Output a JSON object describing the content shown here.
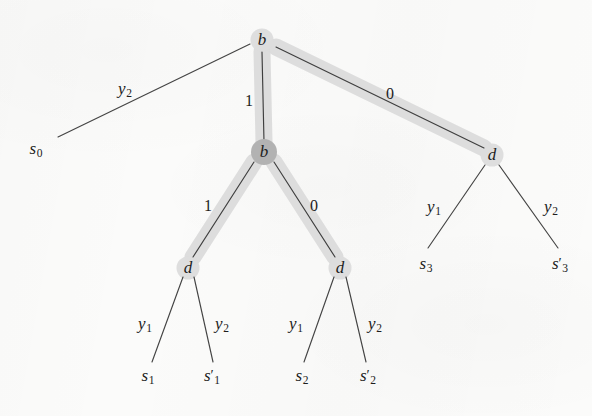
{
  "figure": {
    "kind": "tree-diagram",
    "background_color": "#fbfbfa",
    "ink_color": "#1d1d1d",
    "highlight_color": "#dcdcdc",
    "node_fill_light": "#d2d2d2",
    "node_fill_dark": "#b2b2b2"
  },
  "nodes": [
    {
      "id": "b-root",
      "label": "b",
      "x": 262,
      "y": 40,
      "shape": "circle",
      "fill": "light"
    },
    {
      "id": "b-second",
      "label": "b",
      "x": 264,
      "y": 152,
      "shape": "circle",
      "fill": "dark"
    },
    {
      "id": "d-left",
      "label": "d",
      "x": 188,
      "y": 268,
      "shape": "circle",
      "fill": "light"
    },
    {
      "id": "d-mid",
      "label": "d",
      "x": 340,
      "y": 268,
      "shape": "circle",
      "fill": "light"
    },
    {
      "id": "d-right",
      "label": "d",
      "x": 492,
      "y": 155,
      "shape": "circle",
      "fill": "light"
    }
  ],
  "edges": [
    {
      "id": "e-root-s0",
      "from": "b-root",
      "to": "s0",
      "label": "y",
      "sub": "2",
      "math": true,
      "label_x": 125,
      "label_y": 90,
      "highlighted": false,
      "x1": 250,
      "y1": 44,
      "x2": 58,
      "y2": 137
    },
    {
      "id": "e-root-b2",
      "from": "b-root",
      "to": "b-second",
      "label": "1",
      "sub": "",
      "math": false,
      "label_x": 249,
      "label_y": 101,
      "highlighted": true,
      "x1": 262,
      "y1": 52,
      "x2": 264,
      "y2": 142
    },
    {
      "id": "e-root-dright",
      "from": "b-root",
      "to": "d-right",
      "label": "0",
      "sub": "",
      "math": false,
      "label_x": 390,
      "label_y": 94,
      "highlighted": true,
      "x1": 276,
      "y1": 47,
      "x2": 484,
      "y2": 148
    },
    {
      "id": "e-b2-dleft",
      "from": "b-second",
      "to": "d-left",
      "label": "1",
      "sub": "",
      "math": false,
      "label_x": 208,
      "label_y": 206,
      "highlighted": true,
      "x1": 254,
      "y1": 162,
      "x2": 193,
      "y2": 257
    },
    {
      "id": "e-b2-dmid",
      "from": "b-second",
      "to": "d-mid",
      "label": "0",
      "sub": "",
      "math": false,
      "label_x": 314,
      "label_y": 206,
      "highlighted": true,
      "x1": 274,
      "y1": 162,
      "x2": 335,
      "y2": 257
    },
    {
      "id": "e-dleft-s1",
      "from": "d-left",
      "to": "s1",
      "label": "y",
      "sub": "1",
      "math": true,
      "label_x": 145,
      "label_y": 325,
      "highlighted": false,
      "x1": 183,
      "y1": 277,
      "x2": 152,
      "y2": 362
    },
    {
      "id": "e-dleft-s1p",
      "from": "d-left",
      "to": "s1p",
      "label": "y",
      "sub": "2",
      "math": true,
      "label_x": 222,
      "label_y": 325,
      "highlighted": false,
      "x1": 194,
      "y1": 277,
      "x2": 213,
      "y2": 362
    },
    {
      "id": "e-dmid-s2",
      "from": "d-mid",
      "to": "s2",
      "label": "y",
      "sub": "1",
      "math": true,
      "label_x": 296,
      "label_y": 325,
      "highlighted": false,
      "x1": 334,
      "y1": 277,
      "x2": 304,
      "y2": 362
    },
    {
      "id": "e-dmid-s2p",
      "from": "d-mid",
      "to": "s2p",
      "label": "y",
      "sub": "2",
      "math": true,
      "label_x": 375,
      "label_y": 325,
      "highlighted": false,
      "x1": 346,
      "y1": 277,
      "x2": 366,
      "y2": 362
    },
    {
      "id": "e-dright-s3",
      "from": "d-right",
      "to": "s3",
      "label": "y",
      "sub": "1",
      "math": true,
      "label_x": 434,
      "label_y": 208,
      "highlighted": false,
      "x1": 485,
      "y1": 165,
      "x2": 428,
      "y2": 248
    },
    {
      "id": "e-dright-s3p",
      "from": "d-right",
      "to": "s3p",
      "label": "y",
      "sub": "2",
      "math": true,
      "label_x": 551,
      "label_y": 208,
      "highlighted": false,
      "x1": 499,
      "y1": 165,
      "x2": 558,
      "y2": 248
    }
  ],
  "leaves": [
    {
      "id": "s0",
      "label": "s",
      "sub": "0",
      "prime": false,
      "x": 36,
      "y": 150
    },
    {
      "id": "s1",
      "label": "s",
      "sub": "1",
      "prime": false,
      "x": 148,
      "y": 377
    },
    {
      "id": "s1p",
      "label": "s",
      "sub": "1",
      "prime": true,
      "x": 212,
      "y": 377
    },
    {
      "id": "s2",
      "label": "s",
      "sub": "2",
      "prime": false,
      "x": 302,
      "y": 377
    },
    {
      "id": "s2p",
      "label": "s",
      "sub": "2",
      "prime": true,
      "x": 368,
      "y": 377
    },
    {
      "id": "s3",
      "label": "s",
      "sub": "3",
      "prime": false,
      "x": 426,
      "y": 265
    },
    {
      "id": "s3p",
      "label": "s",
      "sub": "3",
      "prime": true,
      "x": 560,
      "y": 265
    }
  ]
}
